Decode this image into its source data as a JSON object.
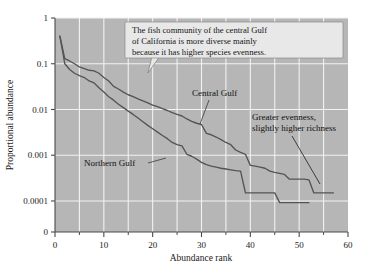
{
  "chart_data": {
    "type": "line",
    "title": "",
    "xlabel": "Abundance rank",
    "ylabel": "Proportional abundance",
    "xlim": [
      0,
      60
    ],
    "ylim": [
      0.0001,
      1
    ],
    "yscale": "log",
    "grid": true,
    "legend_position": "inline-labels",
    "background_color": "#b6b6b6",
    "gridline_color": "#f2f2f2",
    "line_color": "#4a4a4a",
    "x_ticks_major": [
      0,
      10,
      20,
      30,
      40,
      50,
      60
    ],
    "x_tick_labels": [
      "0",
      "10",
      "20",
      "30",
      "40",
      "50",
      "60"
    ],
    "x_ticks_minor": [
      5,
      15,
      25,
      35,
      45,
      55
    ],
    "y_ticks": [
      1,
      0.1,
      0.01,
      0.001,
      0.0001,
      0
    ],
    "y_tick_labels": [
      "1",
      "0.1",
      "0.01",
      "0.001",
      "0.0001",
      "0"
    ],
    "series": [
      {
        "name": "Central Gulf",
        "x": [
          1,
          2,
          3,
          4,
          5,
          6,
          7,
          8,
          9,
          10,
          11,
          12,
          13,
          14,
          15,
          16,
          17,
          18,
          19,
          20,
          21,
          22,
          23,
          24,
          25,
          26,
          27,
          28,
          29,
          30,
          31,
          32,
          33,
          34,
          35,
          36,
          37,
          38,
          39,
          40,
          41,
          42,
          43,
          44,
          45,
          46,
          47,
          48,
          49,
          50,
          51,
          52,
          53,
          54,
          55,
          56,
          57
        ],
        "values": [
          0.4,
          0.13,
          0.115,
          0.1,
          0.085,
          0.078,
          0.072,
          0.07,
          0.062,
          0.05,
          0.042,
          0.032,
          0.028,
          0.024,
          0.021,
          0.019,
          0.017,
          0.0155,
          0.014,
          0.0125,
          0.0115,
          0.0105,
          0.0095,
          0.0085,
          0.0078,
          0.0072,
          0.0062,
          0.0055,
          0.005,
          0.0047,
          0.003,
          0.0028,
          0.0025,
          0.0022,
          0.0019,
          0.0017,
          0.0013,
          0.00115,
          0.00105,
          0.0006,
          0.00058,
          0.00055,
          0.00052,
          0.00045,
          0.00042,
          0.0004,
          0.00038,
          0.0003,
          0.0003,
          0.0003,
          0.0003,
          0.00029,
          0.00015,
          0.00015,
          0.00015,
          0.00015,
          0.00015
        ]
      },
      {
        "name": "Northern Gulf",
        "x": [
          1,
          2,
          3,
          4,
          5,
          6,
          7,
          8,
          9,
          10,
          11,
          12,
          13,
          14,
          15,
          16,
          17,
          18,
          19,
          20,
          21,
          22,
          23,
          24,
          25,
          26,
          27,
          28,
          29,
          30,
          31,
          32,
          33,
          34,
          35,
          36,
          37,
          38,
          39,
          40,
          41,
          42,
          43,
          44,
          45,
          46,
          47,
          48,
          49,
          50,
          51,
          52
        ],
        "values": [
          0.4,
          0.1,
          0.075,
          0.062,
          0.055,
          0.05,
          0.042,
          0.038,
          0.03,
          0.024,
          0.019,
          0.016,
          0.013,
          0.011,
          0.0092,
          0.0078,
          0.0065,
          0.0054,
          0.0045,
          0.0038,
          0.0032,
          0.0027,
          0.0023,
          0.0019,
          0.0017,
          0.0016,
          0.00105,
          0.00095,
          0.00082,
          0.0007,
          0.00062,
          0.00058,
          0.00055,
          0.00052,
          0.0005,
          0.00048,
          0.00046,
          0.00045,
          0.00015,
          0.00015,
          0.00015,
          0.00015,
          0.00015,
          0.00015,
          0.00015,
          9.2e-05,
          9.2e-05,
          9.2e-05,
          9.2e-05,
          9.2e-05,
          9.2e-05,
          9.2e-05
        ]
      }
    ],
    "annotations": [
      {
        "id": "callout",
        "lines": [
          "The fish community of the central Gulf",
          "of California is more diverse mainly",
          "because it has higher species evenness."
        ],
        "style": "boxed-callout"
      },
      {
        "id": "central-gulf-label",
        "text": "Central Gulf",
        "style": "leader-line"
      },
      {
        "id": "northern-gulf-label",
        "text": "Northern Gulf",
        "style": "leader-line"
      },
      {
        "id": "richness-note",
        "lines": [
          "Greater evenness,",
          "slightly higher richness"
        ],
        "style": "leader-line"
      }
    ]
  }
}
